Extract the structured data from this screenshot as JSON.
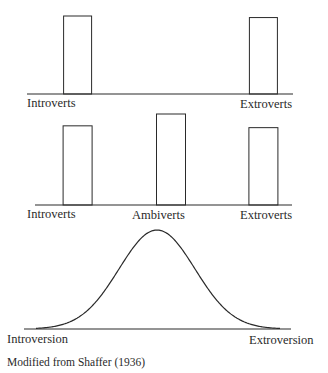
{
  "chart_data": [
    {
      "type": "bar",
      "title": "",
      "categories": [
        "Introverts",
        "Extroverts"
      ],
      "values": [
        1.0,
        0.98
      ],
      "xlabel": "",
      "ylabel": "",
      "positions": [
        0.1,
        0.9
      ],
      "note": "Two-type dichotomy: introverts and extroverts only"
    },
    {
      "type": "bar",
      "title": "",
      "categories": [
        "Introverts",
        "Ambiverts",
        "Extroverts"
      ],
      "values": [
        0.87,
        1.0,
        0.85
      ],
      "xlabel": "",
      "ylabel": "",
      "positions": [
        0.1,
        0.5,
        0.9
      ],
      "note": "Three-type classification adding ambiverts"
    },
    {
      "type": "line",
      "title": "",
      "shape": "normal distribution",
      "x_labels": {
        "left": "Introversion",
        "right": "Extroversion"
      },
      "x_range": [
        0,
        1
      ],
      "peak": 0.5
    }
  ],
  "labels": {
    "chart1": {
      "left": "Introverts",
      "right": "Extroverts"
    },
    "chart2": {
      "left": "Introverts",
      "middle": "Ambiverts",
      "right": "Extroverts"
    },
    "chart3": {
      "left": "Introversion",
      "right": "Extroversion"
    }
  },
  "caption": "Modified from Shaffer (1936)"
}
